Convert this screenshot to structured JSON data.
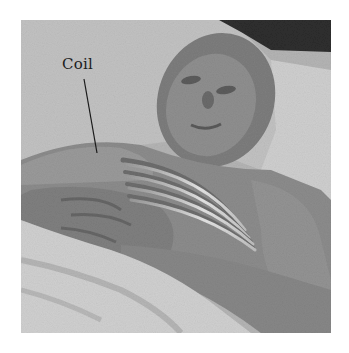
{
  "figure": {
    "annotation": {
      "label": "Coil"
    },
    "colors": {
      "background": "#ffffff",
      "photo_base": "#a9a9a9",
      "label_text": "#1c1c1c"
    }
  }
}
